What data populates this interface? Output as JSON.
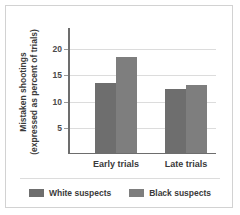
{
  "chart_data": {
    "type": "bar",
    "title": "",
    "subtitle": "",
    "xlabel": "",
    "ylabel": "Mistaken shootings (expressed as percent of trials)",
    "ylabel_lines": [
      "Mistaken shootings",
      "(expressed as percent of trials)"
    ],
    "categories": [
      "Early trials",
      "Late trials"
    ],
    "series": [
      {
        "name": "White suspects",
        "values": [
          13.3,
          12.2
        ],
        "color": "#6e6e6e"
      },
      {
        "name": "Black suspects",
        "values": [
          18.2,
          13.0
        ],
        "color": "#7e7e7e"
      }
    ],
    "yticks": [
      5,
      10,
      15,
      20
    ],
    "ytick_labels": [
      "5",
      "10",
      "15",
      "20"
    ],
    "ylim": [
      0,
      24
    ],
    "grid": true,
    "legend_position": "bottom",
    "annotations": []
  },
  "figure": {
    "border_color": "#d2d2d2",
    "background": "#ffffff",
    "axis_color": "#6d6d6d",
    "gridline_color": "#dcdcdc"
  }
}
